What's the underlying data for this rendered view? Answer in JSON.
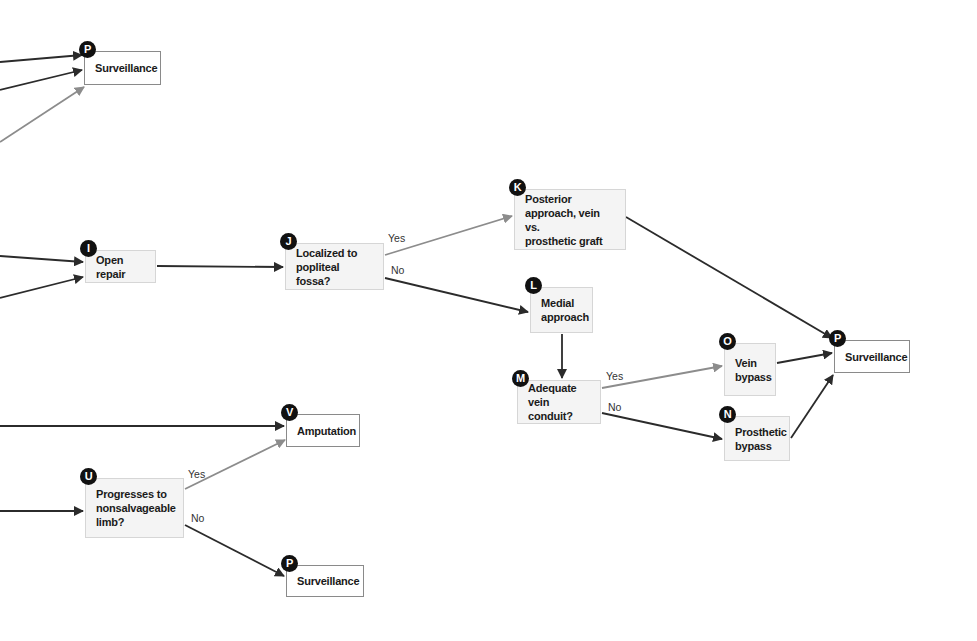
{
  "colors": {
    "arrow_dark": "#2b2b2b",
    "arrow_gray": "#8c8c8c",
    "badge": "#111111"
  },
  "nodes": [
    {
      "id": "P_top",
      "badge": "P",
      "label": "Surveillance",
      "kind": "terminal",
      "x": 84,
      "y": 51,
      "w": 77,
      "h": 34
    },
    {
      "id": "I",
      "badge": "I",
      "label": "Open repair",
      "kind": "step",
      "x": 85,
      "y": 250,
      "w": 71,
      "h": 33
    },
    {
      "id": "J",
      "badge": "J",
      "label": "Localized to\npopliteal fossa?",
      "kind": "step",
      "x": 285,
      "y": 243,
      "w": 99,
      "h": 47
    },
    {
      "id": "K",
      "badge": "K",
      "label": "Posterior\napproach, vein vs.\nprosthetic graft",
      "kind": "step",
      "x": 514,
      "y": 189,
      "w": 112,
      "h": 61
    },
    {
      "id": "L",
      "badge": "L",
      "label": "Medial\napproach",
      "kind": "step",
      "x": 530,
      "y": 287,
      "w": 63,
      "h": 46
    },
    {
      "id": "M",
      "badge": "M",
      "label": "Adequate\nvein conduit?",
      "kind": "step",
      "x": 517,
      "y": 380,
      "w": 84,
      "h": 44
    },
    {
      "id": "O",
      "badge": "O",
      "label": "Vein\nbypass",
      "kind": "step",
      "x": 724,
      "y": 343,
      "w": 52,
      "h": 53
    },
    {
      "id": "N",
      "badge": "N",
      "label": "Prosthetic\nbypass",
      "kind": "step",
      "x": 724,
      "y": 416,
      "w": 66,
      "h": 45
    },
    {
      "id": "P_right",
      "badge": "P",
      "label": "Surveillance",
      "kind": "terminal",
      "x": 834,
      "y": 340,
      "w": 76,
      "h": 33
    },
    {
      "id": "V",
      "badge": "V",
      "label": "Amputation",
      "kind": "terminal",
      "x": 286,
      "y": 414,
      "w": 74,
      "h": 33
    },
    {
      "id": "U",
      "badge": "U",
      "label": "Progresses to\nnonsalvageable\nlimb?",
      "kind": "step",
      "x": 85,
      "y": 478,
      "w": 99,
      "h": 60
    },
    {
      "id": "P_bottom",
      "badge": "P",
      "label": "Surveillance",
      "kind": "terminal",
      "x": 286,
      "y": 565,
      "w": 78,
      "h": 32
    }
  ],
  "edges": [
    {
      "x1": 0,
      "y1": 62,
      "x2": 82,
      "y2": 55,
      "color": "dark",
      "label": ""
    },
    {
      "x1": 0,
      "y1": 90,
      "x2": 82,
      "y2": 70,
      "color": "dark",
      "label": ""
    },
    {
      "x1": 0,
      "y1": 142,
      "x2": 84,
      "y2": 87,
      "color": "gray",
      "label": ""
    },
    {
      "x1": 0,
      "y1": 256,
      "x2": 83,
      "y2": 262,
      "color": "dark",
      "label": ""
    },
    {
      "x1": 0,
      "y1": 298,
      "x2": 83,
      "y2": 277,
      "color": "dark",
      "label": ""
    },
    {
      "x1": 157,
      "y1": 266,
      "x2": 283,
      "y2": 267,
      "color": "dark",
      "label": ""
    },
    {
      "x1": 385,
      "y1": 255,
      "x2": 512,
      "y2": 216,
      "color": "gray",
      "label": "Yes",
      "lx": 388,
      "ly": 232
    },
    {
      "x1": 385,
      "y1": 278,
      "x2": 528,
      "y2": 312,
      "color": "dark",
      "label": "No",
      "lx": 391,
      "ly": 264
    },
    {
      "x1": 562,
      "y1": 334,
      "x2": 562,
      "y2": 378,
      "color": "dark",
      "label": ""
    },
    {
      "x1": 602,
      "y1": 388,
      "x2": 722,
      "y2": 366,
      "color": "gray",
      "label": "Yes",
      "lx": 606,
      "ly": 370
    },
    {
      "x1": 602,
      "y1": 413,
      "x2": 722,
      "y2": 439,
      "color": "dark",
      "label": "No",
      "lx": 608,
      "ly": 401
    },
    {
      "x1": 626,
      "y1": 217,
      "x2": 832,
      "y2": 338,
      "color": "dark",
      "label": ""
    },
    {
      "x1": 777,
      "y1": 363,
      "x2": 832,
      "y2": 353,
      "color": "dark",
      "label": ""
    },
    {
      "x1": 791,
      "y1": 438,
      "x2": 833,
      "y2": 375,
      "color": "dark",
      "label": ""
    },
    {
      "x1": 0,
      "y1": 426,
      "x2": 284,
      "y2": 426,
      "color": "dark",
      "label": ""
    },
    {
      "x1": 0,
      "y1": 511,
      "x2": 83,
      "y2": 511,
      "color": "dark",
      "label": ""
    },
    {
      "x1": 185,
      "y1": 489,
      "x2": 285,
      "y2": 440,
      "color": "gray",
      "label": "Yes",
      "lx": 188,
      "ly": 468
    },
    {
      "x1": 185,
      "y1": 525,
      "x2": 284,
      "y2": 576,
      "color": "dark",
      "label": "No",
      "lx": 191,
      "ly": 512
    }
  ]
}
